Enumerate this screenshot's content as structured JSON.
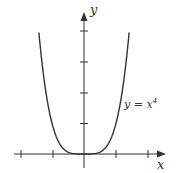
{
  "chart_data": {
    "type": "line",
    "title": "",
    "xlabel": "x",
    "ylabel": "y",
    "series": [
      {
        "name": "y = x^4",
        "label": "y = x⁴",
        "function": "x^4",
        "x": [
          -1.4,
          -1.2,
          -1.0,
          -0.8,
          -0.6,
          -0.4,
          -0.2,
          0,
          0.2,
          0.4,
          0.6,
          0.8,
          1.0,
          1.2,
          1.4
        ],
        "values": [
          3.84,
          2.07,
          1.0,
          0.41,
          0.13,
          0.03,
          0.0,
          0,
          0.0,
          0.03,
          0.13,
          0.41,
          1.0,
          2.07,
          3.84
        ]
      }
    ],
    "x_ticks": [
      -2,
      -1,
      1,
      2
    ],
    "y_ticks": [
      1,
      2,
      3,
      4
    ],
    "xlim": [
      -2.0,
      2.5
    ],
    "ylim": [
      -0.5,
      4.6
    ],
    "grid": false,
    "legend": "none",
    "annotations": [
      {
        "text": "y = x⁴",
        "x": 1.3,
        "y": 1.6
      }
    ]
  },
  "labels": {
    "x_axis": "x",
    "y_axis": "y",
    "curve": "y = x",
    "curve_exp": "4"
  },
  "colors": {
    "axis": "#333333",
    "curve": "#333333"
  }
}
